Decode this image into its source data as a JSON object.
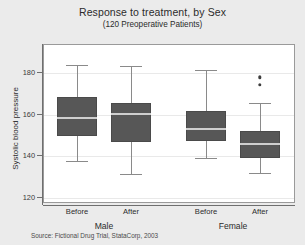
{
  "chart_data": {
    "type": "box",
    "title": "Response to treatment, by Sex",
    "subtitle": "(120 Preoperative Patients)",
    "ylabel": "Systolic blood pressure",
    "xlabel": "",
    "source": "Source: Fictional Drug Trial, StataCorp, 2003",
    "ylim": [
      116,
      190
    ],
    "yticks": [
      120,
      140,
      160,
      180
    ],
    "ytick_labels": [
      "120",
      "140",
      "160",
      "180"
    ],
    "grid": true,
    "legend": "none",
    "groups": [
      {
        "name": "Male",
        "categories": [
          "Before",
          "After"
        ]
      },
      {
        "name": "Female",
        "categories": [
          "Before",
          "After"
        ]
      }
    ],
    "boxes": [
      {
        "group": "Male",
        "category": "Before",
        "min": 137.5,
        "q1": 149.5,
        "median": 158.0,
        "q3": 168.0,
        "max": 183.5,
        "outliers": []
      },
      {
        "group": "Male",
        "category": "After",
        "min": 131.0,
        "q1": 146.5,
        "median": 160.0,
        "q3": 165.0,
        "max": 183.0,
        "outliers": []
      },
      {
        "group": "Female",
        "category": "Before",
        "min": 138.5,
        "q1": 147.0,
        "median": 152.5,
        "q3": 161.5,
        "max": 181.0,
        "outliers": []
      },
      {
        "group": "Female",
        "category": "After",
        "min": 131.5,
        "q1": 138.5,
        "median": 145.5,
        "q3": 151.5,
        "max": 165.0,
        "outliers": [
          177.5,
          174.0
        ]
      }
    ]
  },
  "axis": {
    "ytick_0": "120",
    "ytick_1": "140",
    "ytick_2": "160",
    "ytick_3": "180",
    "title": "Systolic blood pressure",
    "x_labels": [
      "Before",
      "After",
      "Before",
      "After"
    ],
    "group_labels": [
      "Male",
      "Female"
    ]
  },
  "colors": {
    "background": "#ebebeb",
    "plot_background": "#ffffff",
    "box_fill": "#575757",
    "median_line": "#cfcfcf",
    "whisker": "#8a8a8a",
    "axis": "#6f6f6f",
    "grid": "#e9e9e9",
    "outlier": "#3d3d3d"
  }
}
